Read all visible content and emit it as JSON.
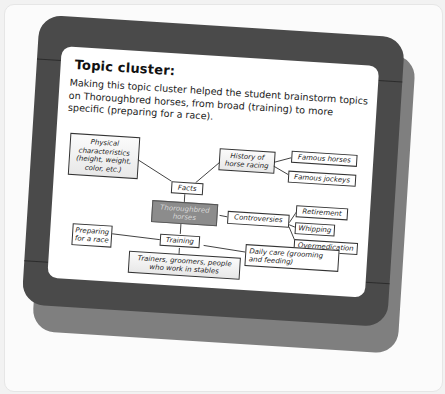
{
  "card": {
    "title": "Topic cluster:",
    "description": "Making this topic cluster helped the student brainstorm topics on Thoroughbred horses, from broad (training) to more specific (preparing for a race).",
    "colors": {
      "frame": "#4a4a4a",
      "frame_shadow": "#7f7f7f",
      "panel": "#ffffff",
      "central_node": "#8c8c8c",
      "background": "#fbfbfb"
    }
  },
  "diagram": {
    "central": "Thoroughbred horses",
    "nodes": {
      "physical": "Physical characteristics (height, weight, color, etc.)",
      "facts": "Facts",
      "history": "History of horse racing",
      "famous_horses": "Famous horses",
      "famous_jockeys": "Famous jockeys",
      "controversies": "Controversies",
      "retirement": "Retirement",
      "whipping": "Whipping",
      "overmedication": "Overmedication",
      "training": "Training",
      "preparing": "Preparing for a race",
      "daily_care": "Daily care (grooming and feeding)",
      "trainers": "Trainers, groomers, people who work in stables"
    },
    "edges": [
      [
        "Thoroughbred horses",
        "Facts"
      ],
      [
        "Facts",
        "Physical characteristics (height, weight, color, etc.)"
      ],
      [
        "Facts",
        "History of horse racing"
      ],
      [
        "History of horse racing",
        "Famous horses"
      ],
      [
        "History of horse racing",
        "Famous jockeys"
      ],
      [
        "Thoroughbred horses",
        "Controversies"
      ],
      [
        "Controversies",
        "Retirement"
      ],
      [
        "Controversies",
        "Whipping"
      ],
      [
        "Controversies",
        "Overmedication"
      ],
      [
        "Thoroughbred horses",
        "Training"
      ],
      [
        "Training",
        "Preparing for a race"
      ],
      [
        "Training",
        "Daily care (grooming and feeding)"
      ],
      [
        "Training",
        "Trainers, groomers, people who work in stables"
      ]
    ]
  }
}
